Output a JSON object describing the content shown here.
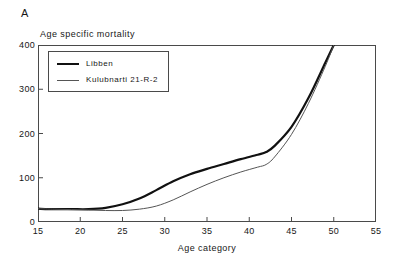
{
  "panel": {
    "label": "A"
  },
  "axes": {
    "y_title": "Age specific mortality",
    "x_title": "Age category",
    "y_ticks": [
      "0",
      "100",
      "200",
      "300",
      "400"
    ],
    "x_ticks": [
      "15",
      "20",
      "25",
      "30",
      "35",
      "40",
      "45",
      "50",
      "55"
    ]
  },
  "legend": {
    "entries": [
      {
        "label": "Libben",
        "style": "thick",
        "color": "#111111"
      },
      {
        "label": "Kulubnarti 21-R-2",
        "style": "thin",
        "color": "#555555"
      }
    ]
  },
  "colors": {
    "libben": "#111111",
    "kulubnarti": "#555555",
    "frame": "#4a4a4a",
    "background": "#ffffff"
  },
  "chart_data": {
    "type": "line",
    "title": "",
    "subtitle": "",
    "panel_label": "A",
    "xlabel": "Age category",
    "ylabel": "Age specific mortality",
    "xlim": [
      15,
      55
    ],
    "ylim": [
      0,
      400
    ],
    "xticks": [
      15,
      20,
      25,
      30,
      35,
      40,
      45,
      50,
      55
    ],
    "yticks": [
      0,
      100,
      200,
      300,
      400
    ],
    "grid": false,
    "legend_position": "upper left",
    "x": [
      15,
      17,
      19,
      21,
      23,
      25,
      27,
      29,
      31,
      33,
      35,
      37,
      39,
      41,
      42,
      43,
      45,
      47,
      49,
      50
    ],
    "series": [
      {
        "name": "Libben",
        "color": "#111111",
        "linewidth": 2.2,
        "values": [
          30,
          29,
          29,
          29,
          32,
          40,
          53,
          72,
          92,
          108,
          120,
          131,
          142,
          152,
          158,
          172,
          215,
          280,
          360,
          400
        ]
      },
      {
        "name": "Kulubnarti 21-R-2",
        "color": "#555555",
        "linewidth": 1.0,
        "values": [
          30,
          29,
          28,
          27,
          26,
          26,
          29,
          36,
          50,
          68,
          85,
          100,
          113,
          124,
          130,
          147,
          198,
          268,
          352,
          400
        ]
      }
    ]
  }
}
